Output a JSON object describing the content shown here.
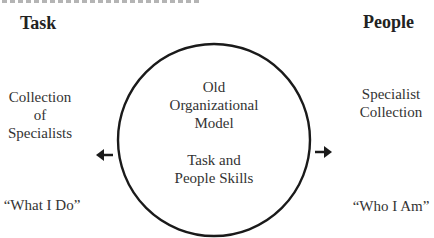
{
  "headings": {
    "left": "Task",
    "right": "People"
  },
  "circle": {
    "line1": "Old",
    "line2": "Organizational",
    "line3": "Model",
    "line4": "Task and",
    "line5": "People Skills"
  },
  "left_side": {
    "line1": "Collection",
    "line2": "of",
    "line3": "Specialists",
    "quote": "“What I Do”"
  },
  "right_side": {
    "line1": "Specialist",
    "line2": "Collection",
    "quote": "“Who I Am”"
  },
  "arrows": {
    "left": "arrow-left-icon",
    "right": "arrow-right-icon"
  },
  "colors": {
    "stroke": "#1a1a1a",
    "text": "#333333"
  }
}
